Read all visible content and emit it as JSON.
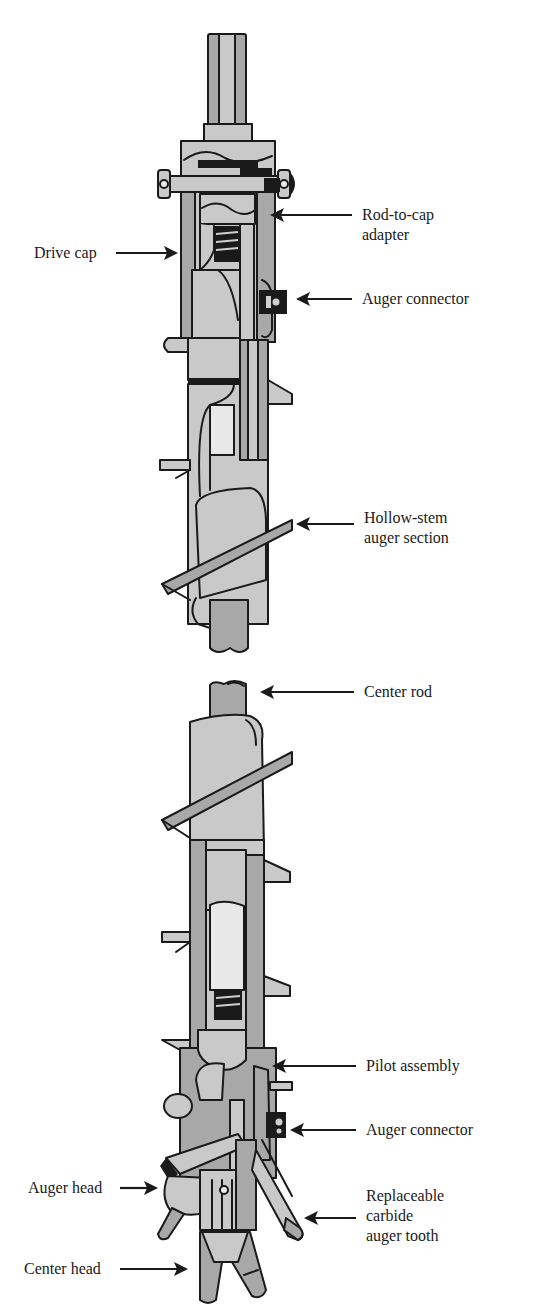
{
  "figure": {
    "colors": {
      "outline": "#1a1a1a",
      "light_fill": "#c9c9c9",
      "mid_fill": "#a8a8a8",
      "dark_fill": "#1a1a1a",
      "background": "#ffffff"
    }
  },
  "labels": {
    "drive_cap": "Drive cap",
    "rod_to_cap_adapter": [
      "Rod-to-cap",
      "adapter"
    ],
    "auger_connector_top": "Auger connector",
    "hollow_stem_auger_section": [
      "Hollow-stem",
      "auger section"
    ],
    "center_rod": "Center rod",
    "pilot_assembly": "Pilot assembly",
    "auger_connector_bottom": "Auger connector",
    "auger_head": "Auger head",
    "replaceable_carbide_auger_tooth": [
      "Replaceable",
      "carbide",
      "auger tooth"
    ],
    "center_head": "Center head"
  }
}
